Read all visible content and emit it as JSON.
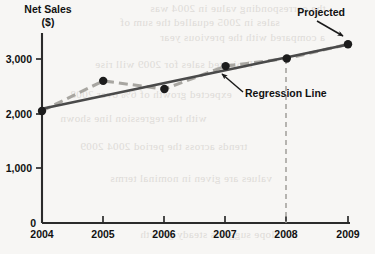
{
  "chart_data": {
    "type": "line",
    "title": "",
    "ylabel": "Net Sales ($)",
    "ylabel_line1": "Net Sales",
    "ylabel_line2": "($)",
    "xlabel": "",
    "categories": [
      "2004",
      "2005",
      "2006",
      "2007",
      "2008",
      "2009"
    ],
    "x": [
      2004,
      2005,
      2006,
      2007,
      2008,
      2009
    ],
    "ylim": [
      0,
      3400
    ],
    "xlim": [
      2004,
      2009
    ],
    "grid": false,
    "legend": "none",
    "y_ticks": [
      0,
      1000,
      2000,
      3000
    ],
    "y_tick_labels": [
      "0",
      "1,000",
      "2,000",
      "3,000"
    ],
    "x_tick_labels": [
      "2004",
      "2005",
      "2006",
      "2007",
      "2008",
      "2009"
    ],
    "series": [
      {
        "name": "Net Sales",
        "style": "dashed",
        "color": "#a8a6a1",
        "marker": "circle",
        "marker_color": "#1c1c1c",
        "values": [
          2050,
          2600,
          2450,
          2870,
          3010,
          3270
        ]
      },
      {
        "name": "Regression Line",
        "style": "solid",
        "color": "#4a4a4a",
        "marker": "none",
        "values": [
          2090,
          2325,
          2560,
          2795,
          3030,
          3265
        ]
      }
    ],
    "annotations": [
      {
        "name": "projected",
        "text": "Projected",
        "points_to": "2009",
        "value": 3270
      },
      {
        "name": "regression-line",
        "text": "Regression Line",
        "points_to": "regression line"
      },
      {
        "name": "projection-divider",
        "text": "",
        "style": "dashed-vertical",
        "at": "2008"
      }
    ]
  },
  "colors": {
    "axis": "#2b2b2b",
    "data_line": "#a8a6a1",
    "regression_line": "#4a4a4a",
    "marker": "#1c1c1c",
    "annotation_text": "#1a1a1a",
    "divider": "#9a9893",
    "background": "#f7f6f4"
  },
  "background_bleed": {
    "note": "faint mirrored show-through text from reverse page",
    "lines": [
      "the corresponding value in 2004 was",
      "sales in 2005 equalled the sum of",
      "a compared with the previous year",
      "Projected sales for 2009 will rise",
      "expected growth of 6% over 2008",
      "with the regression line shown",
      "trends across the period 2004 2009",
      "values are given in nominal terms",
      "the slope suggests steady growth"
    ]
  }
}
